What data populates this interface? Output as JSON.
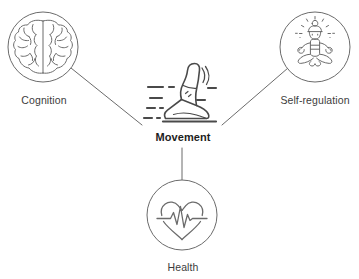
{
  "diagram": {
    "background_color": "#ffffff",
    "icon_stroke_color": "#6b6b6b",
    "connector_color": "#5a5a5a",
    "label_color": "#3c3c3c",
    "center_label_color": "#1d1d1d"
  },
  "nodes": {
    "cognition": {
      "label": "Cognition",
      "icon": "brain-icon",
      "position": "top-left",
      "circle": {
        "cx": 43,
        "cy": 47,
        "r": 35
      }
    },
    "self_regulation": {
      "label": "Self-regulation",
      "icon": "meditation-icon",
      "position": "top-right",
      "circle": {
        "cx": 315,
        "cy": 47,
        "r": 35
      }
    },
    "movement": {
      "label": "Movement",
      "icon": "running-shoe-icon",
      "position": "center",
      "bold": true
    },
    "health": {
      "label": "Health",
      "icon": "heart-pulse-icon",
      "position": "bottom-center",
      "circle": {
        "cx": 182,
        "cy": 215,
        "r": 35
      }
    }
  },
  "connectors": [
    {
      "name": "cognition-to-movement",
      "from": "cognition",
      "to": "movement"
    },
    {
      "name": "self-regulation-to-movement",
      "from": "self_regulation",
      "to": "movement"
    },
    {
      "name": "movement-to-health",
      "from": "movement",
      "to": "health"
    }
  ]
}
